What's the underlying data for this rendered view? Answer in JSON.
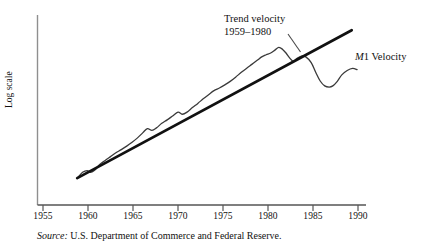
{
  "chart_data": {
    "type": "line",
    "title": "",
    "xlabel": "",
    "ylabel": "Log scale",
    "xlim": [
      1953.5,
      1991.5
    ],
    "ylim": [
      0,
      1
    ],
    "grid": false,
    "legend_position": "inline-annotations",
    "xticks": [
      "1955",
      "1960",
      "1965",
      "1970",
      "1975",
      "1980",
      "1985",
      "1990"
    ],
    "xtick_values": [
      1955,
      1960,
      1965,
      1970,
      1975,
      1980,
      1985,
      1990
    ],
    "yticks": [],
    "series": [
      {
        "name": "M1 Velocity",
        "style": "wavy-line",
        "color": "#3a3a3a",
        "x": [
          1958.9,
          1959.4,
          1959.9,
          1960.3,
          1960.8,
          1961.3,
          1961.9,
          1962.5,
          1963.1,
          1963.7,
          1964.3,
          1964.9,
          1965.5,
          1966.1,
          1966.6,
          1967.1,
          1967.6,
          1968.2,
          1968.8,
          1969.4,
          1970.0,
          1970.5,
          1971.0,
          1971.6,
          1972.2,
          1972.8,
          1973.4,
          1974.0,
          1974.6,
          1975.2,
          1975.8,
          1976.4,
          1977.0,
          1977.6,
          1978.2,
          1978.8,
          1979.3,
          1979.8,
          1980.3,
          1980.8,
          1981.2,
          1981.6,
          1982.0,
          1982.4,
          1982.8,
          1983.2,
          1983.7,
          1984.2,
          1984.8,
          1985.3,
          1985.8,
          1986.3,
          1986.8,
          1987.2,
          1987.7,
          1988.2,
          1988.8,
          1989.4,
          1989.9
        ],
        "y": [
          0.09,
          0.118,
          0.128,
          0.118,
          0.133,
          0.163,
          0.186,
          0.208,
          0.23,
          0.248,
          0.268,
          0.29,
          0.315,
          0.345,
          0.368,
          0.358,
          0.372,
          0.398,
          0.418,
          0.44,
          0.462,
          0.45,
          0.462,
          0.488,
          0.512,
          0.538,
          0.562,
          0.585,
          0.6,
          0.618,
          0.638,
          0.662,
          0.688,
          0.712,
          0.735,
          0.758,
          0.778,
          0.79,
          0.8,
          0.818,
          0.832,
          0.822,
          0.8,
          0.772,
          0.752,
          0.768,
          0.782,
          0.778,
          0.745,
          0.69,
          0.64,
          0.612,
          0.605,
          0.612,
          0.638,
          0.675,
          0.7,
          0.712,
          0.705
        ]
      },
      {
        "name": "Trend velocity",
        "style": "straight-line",
        "color": "#111111",
        "x": [
          1958.8,
          1989.3
        ],
        "y": [
          0.085,
          0.93
        ]
      }
    ],
    "annotations": [
      {
        "name": "trend-velocity-label",
        "line1": "Trend velocity",
        "line2": "1959–1980",
        "leader": true
      },
      {
        "name": "m1-velocity-label",
        "text_italic": "M",
        "text_rest": "1 Velocity"
      }
    ]
  },
  "axes": {
    "y_title": "Log scale",
    "tick_labels": [
      "1955",
      "1960",
      "1965",
      "1970",
      "1975",
      "1980",
      "1985",
      "1990"
    ]
  },
  "annotations": {
    "trend": {
      "line1": "Trend velocity",
      "line2": "1959–1980"
    },
    "series": {
      "italic_part": "M",
      "rest_part": "1 Velocity"
    }
  },
  "source": {
    "label": "Source:",
    "text": " U.S. Department of Commerce and Federal Reserve."
  },
  "colors": {
    "trend_line": "#111111",
    "series_line": "#3a3a3a",
    "axis": "#8c8c8c",
    "text": "#111111"
  }
}
